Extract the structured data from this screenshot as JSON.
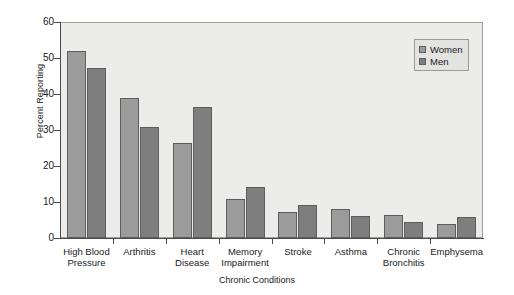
{
  "chart_data": {
    "type": "bar",
    "title": "",
    "xlabel": "Chronic Conditions",
    "ylabel": "Percent Reporting",
    "ylim": [
      0,
      60
    ],
    "yticks": [
      0,
      10,
      20,
      30,
      40,
      50,
      60
    ],
    "grid": false,
    "legend_position": "top-right",
    "categories": [
      "High Blood\nPressure",
      "Arthritis",
      "Heart\nDisease",
      "Memory\nImpairment",
      "Stroke",
      "Asthma",
      "Chronic\nBronchitis",
      "Emphysema"
    ],
    "series": [
      {
        "name": "Women",
        "color": "#9b9b9b",
        "values": [
          52,
          39,
          26.5,
          10.8,
          7.3,
          8,
          6.5,
          3.8
        ]
      },
      {
        "name": "Men",
        "color": "#7e7e7e",
        "values": [
          47.3,
          30.8,
          36.5,
          14.2,
          9.2,
          6,
          4.5,
          5.8
        ]
      }
    ]
  },
  "legend": {
    "items": [
      {
        "label": "Women"
      },
      {
        "label": "Men"
      }
    ]
  },
  "colors": {
    "women_bar": "#9b9b9b",
    "men_bar": "#7e7e7e",
    "plot_background": "#ececeb",
    "axis": "#4a4a4a"
  }
}
